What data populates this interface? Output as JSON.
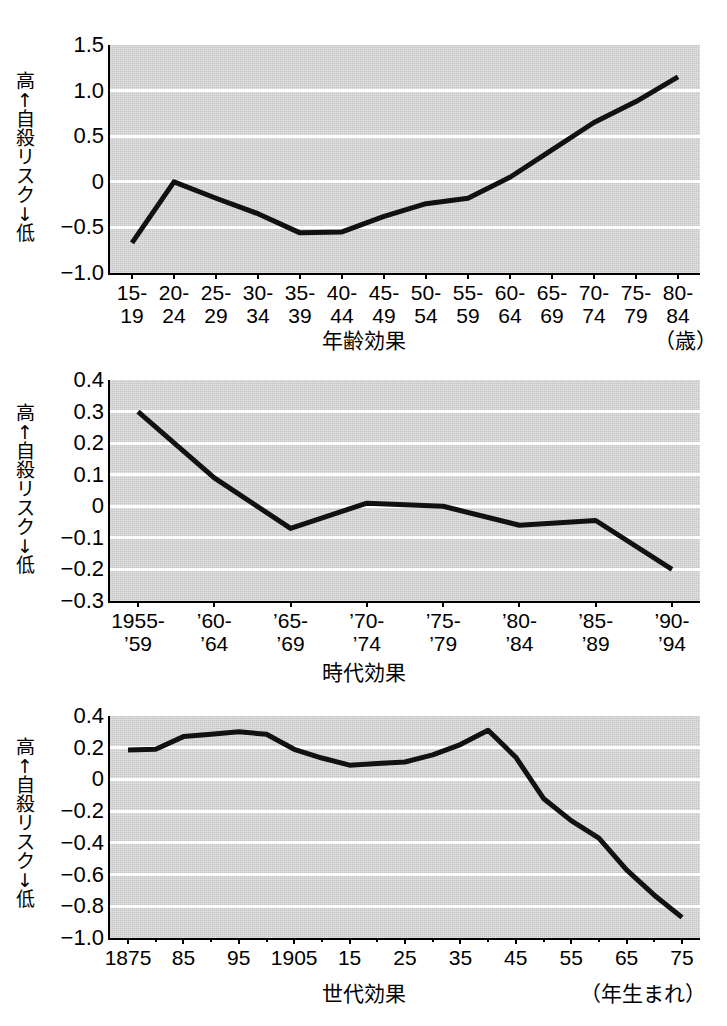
{
  "figure": {
    "background_color": "#ffffff",
    "plot_background_color": "#d5d5d5",
    "gridline_color": "#ffffff",
    "series_color": "#111111",
    "axis_color": "#000000"
  },
  "y_axis_caption": {
    "high": "高",
    "up_arrow": "↑",
    "text": [
      "自",
      "殺",
      "リ",
      "ス",
      "ク"
    ],
    "down_arrow": "↓",
    "low": "低"
  },
  "chart_data": [
    {
      "type": "line",
      "id": "age-effect",
      "title": "",
      "xlabel": "年齢効果",
      "xlabel_unit": "（歳）",
      "ylabel": "高↑自殺リスク↓低",
      "ylim": [
        -1.0,
        1.5
      ],
      "yticks": [
        1.5,
        1.0,
        0.5,
        0,
        -0.5,
        -1.0
      ],
      "ytick_labels": [
        "1.5",
        "1.0",
        "0.5",
        "0",
        "−0.5",
        "−1.0"
      ],
      "grid": true,
      "legend": "none",
      "categories": [
        "15-\n19",
        "20-\n24",
        "25-\n29",
        "30-\n34",
        "35-\n39",
        "40-\n44",
        "45-\n49",
        "50-\n54",
        "55-\n59",
        "60-\n64",
        "65-\n69",
        "70-\n74",
        "75-\n79",
        "80-\n84"
      ],
      "values": [
        -0.67,
        0.0,
        -0.18,
        -0.35,
        -0.56,
        -0.55,
        -0.38,
        -0.24,
        -0.18,
        0.05,
        0.35,
        0.65,
        0.88,
        1.15
      ]
    },
    {
      "type": "line",
      "id": "period-effect",
      "title": "",
      "xlabel": "時代効果",
      "xlabel_unit": "",
      "ylabel": "高↑自殺リスク↓低",
      "ylim": [
        -0.3,
        0.4
      ],
      "yticks": [
        0.4,
        0.3,
        0.2,
        0.1,
        0,
        -0.1,
        -0.2,
        -0.3
      ],
      "ytick_labels": [
        "0.4",
        "0.3",
        "0.2",
        "0.1",
        "0",
        "−0.1",
        "−0.2",
        "−0.3"
      ],
      "grid": true,
      "legend": "none",
      "categories": [
        "1955-\n’59",
        "’60-\n’64",
        "’65-\n’69",
        "’70-\n’74",
        "’75-\n’79",
        "’80-\n’84",
        "’85-\n’89",
        "’90-\n’94"
      ],
      "values": [
        0.3,
        0.09,
        -0.07,
        0.01,
        0.0,
        -0.06,
        -0.045,
        -0.2
      ]
    },
    {
      "type": "line",
      "id": "cohort-effect",
      "title": "",
      "xlabel": "世代効果",
      "xlabel_unit": "（年生まれ）",
      "ylabel": "高↑自殺リスク↓低",
      "ylim": [
        -1.0,
        0.4
      ],
      "yticks": [
        0.4,
        0.2,
        0,
        -0.2,
        -0.4,
        -0.6,
        -0.8,
        -1.0
      ],
      "ytick_labels": [
        "0.4",
        "0.2",
        "0",
        "−0.2",
        "−0.4",
        "−0.6",
        "−0.8",
        "−1.0"
      ],
      "grid": true,
      "legend": "none",
      "categories": [
        "1875",
        "85",
        "95",
        "1905",
        "15",
        "25",
        "35",
        "45",
        "55",
        "65",
        "75"
      ],
      "x": [
        1875,
        1880,
        1885,
        1890,
        1895,
        1900,
        1905,
        1910,
        1915,
        1920,
        1925,
        1930,
        1935,
        1940,
        1945,
        1950,
        1955,
        1960,
        1965,
        1970,
        1975
      ],
      "values": [
        0.185,
        0.19,
        0.27,
        0.285,
        0.3,
        0.285,
        0.19,
        0.135,
        0.09,
        0.1,
        0.11,
        0.155,
        0.22,
        0.31,
        0.14,
        -0.12,
        -0.26,
        -0.37,
        -0.57,
        -0.73,
        -0.87
      ]
    }
  ]
}
